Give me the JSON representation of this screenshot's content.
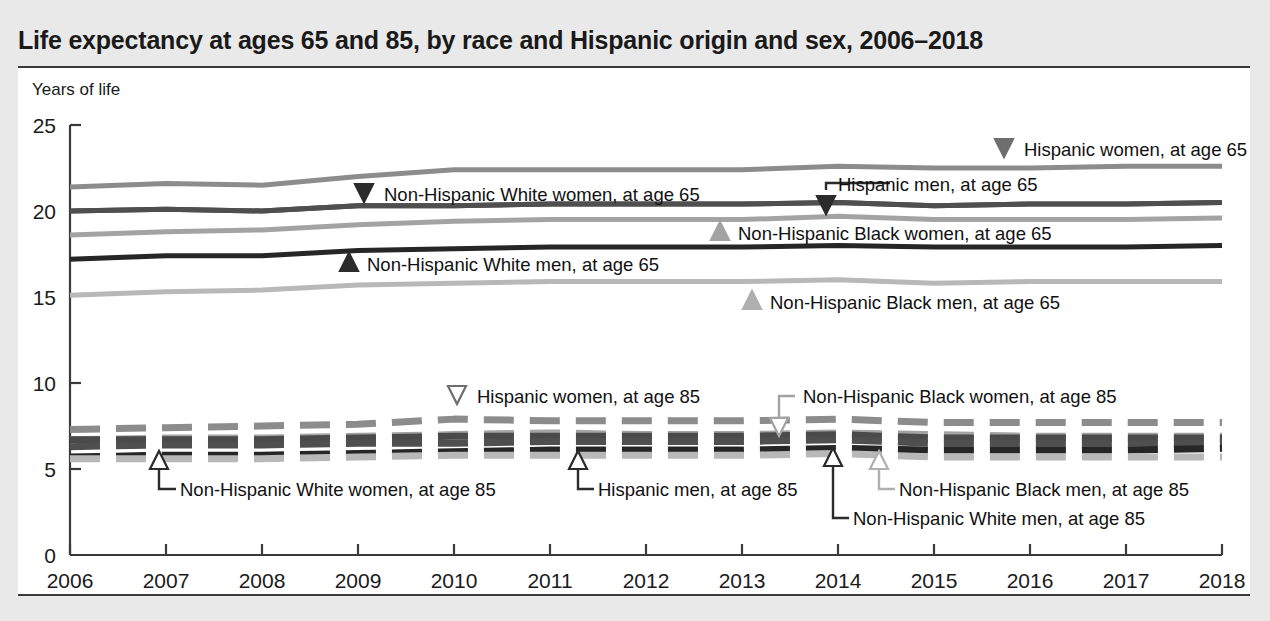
{
  "title": "Life expectancy at ages 65 and 85, by race and Hispanic origin and sex, 2006–2018",
  "axis_label_y": "Years of life",
  "colors": {
    "hispanic_women": "#8c8c8c",
    "hispanic_men": "#4f4f4f",
    "nh_white_women": "#4a4a4a",
    "nh_white_men": "#262626",
    "nh_black_women": "#a3a3a3",
    "nh_black_men": "#b8b8b8",
    "frame": "#3a3a3a",
    "page_bg": "#e9e9e9",
    "plot_bg": "#ffffff"
  },
  "annotations": [
    {
      "id": "hispanic-women-65",
      "text": "Hispanic women, at age 65",
      "marker": "filled-down-triangle",
      "color": "#6e6e6e"
    },
    {
      "id": "nh-white-women-65",
      "text": "Non-Hispanic White women, at age 65",
      "marker": "filled-down-triangle",
      "color": "#2b2b2b"
    },
    {
      "id": "hispanic-men-65",
      "text": "Hispanic men, at age 65",
      "marker": "leader-elbow-filled-down-triangle",
      "color": "#2b2b2b"
    },
    {
      "id": "nh-black-women-65",
      "text": "Non-Hispanic Black women, at age 65",
      "marker": "filled-up-triangle",
      "color": "#a3a3a3"
    },
    {
      "id": "nh-white-men-65",
      "text": "Non-Hispanic White men, at age 65",
      "marker": "filled-up-triangle",
      "color": "#2b2b2b"
    },
    {
      "id": "nh-black-men-65",
      "text": "Non-Hispanic Black men, at age 65",
      "marker": "filled-up-triangle",
      "color": "#b0b0b0"
    },
    {
      "id": "hispanic-women-85",
      "text": "Hispanic women, at age 85",
      "marker": "hollow-down-triangle",
      "color": "#6e6e6e"
    },
    {
      "id": "nh-black-women-85",
      "text": "Non-Hispanic Black women, at age 85",
      "marker": "leader-elbow-hollow-down-triangle",
      "color": "#a3a3a3"
    },
    {
      "id": "nh-white-women-85",
      "text": "Non-Hispanic White women, at age 85",
      "marker": "leader-elbow-hollow-up-triangle",
      "color": "#2b2b2b"
    },
    {
      "id": "hispanic-men-85",
      "text": "Hispanic men, at age 85",
      "marker": "leader-elbow-hollow-up-triangle",
      "color": "#2b2b2b"
    },
    {
      "id": "nh-white-men-85",
      "text": "Non-Hispanic White men, at age 85",
      "marker": "leader-elbow-hollow-up-triangle",
      "color": "#2b2b2b"
    },
    {
      "id": "nh-black-men-85",
      "text": "Non-Hispanic Black men, at age 85",
      "marker": "leader-elbow-hollow-up-triangle",
      "color": "#b0b0b0"
    }
  ],
  "chart_data": {
    "type": "line",
    "title": "Life expectancy at ages 65 and 85, by race and Hispanic origin and sex, 2006–2018",
    "xlabel": "",
    "ylabel": "Years of life",
    "x": [
      2006,
      2007,
      2008,
      2009,
      2010,
      2011,
      2012,
      2013,
      2014,
      2015,
      2016,
      2017,
      2018
    ],
    "xtick_labels": [
      "2006",
      "2007",
      "2008",
      "2009",
      "2010",
      "2011",
      "2012",
      "2013",
      "2014",
      "2015",
      "2016",
      "2017",
      "2018"
    ],
    "ytick_labels": [
      "0",
      "5",
      "10",
      "15",
      "20",
      "25"
    ],
    "yticks": [
      0,
      5,
      10,
      15,
      20,
      25
    ],
    "ylim": [
      0,
      25
    ],
    "xlim": [
      2006,
      2018
    ],
    "grid": false,
    "legend": "inline-annotations",
    "series": [
      {
        "name": "Hispanic women, at age 65",
        "style": "solid",
        "color": "#8c8c8c",
        "values": [
          21.4,
          21.6,
          21.5,
          22.0,
          22.4,
          22.4,
          22.4,
          22.4,
          22.6,
          22.5,
          22.5,
          22.6,
          22.6
        ]
      },
      {
        "name": "Non-Hispanic White women, at age 65",
        "style": "solid",
        "color": "#4a4a4a",
        "values": [
          20.0,
          20.1,
          20.0,
          20.3,
          20.3,
          20.4,
          20.4,
          20.4,
          20.5,
          20.3,
          20.4,
          20.4,
          20.5
        ]
      },
      {
        "name": "Hispanic men, at age 65",
        "style": "solid",
        "color": "#4f4f4f",
        "values": [
          20.0,
          20.1,
          20.0,
          20.3,
          20.3,
          20.4,
          20.4,
          20.4,
          20.5,
          20.3,
          20.4,
          20.4,
          20.5
        ]
      },
      {
        "name": "Non-Hispanic Black women, at age 65",
        "style": "solid",
        "color": "#a3a3a3",
        "values": [
          18.6,
          18.8,
          18.9,
          19.2,
          19.4,
          19.5,
          19.5,
          19.5,
          19.7,
          19.5,
          19.5,
          19.5,
          19.6
        ]
      },
      {
        "name": "Non-Hispanic White men, at age 65",
        "style": "solid",
        "color": "#262626",
        "values": [
          17.2,
          17.4,
          17.4,
          17.7,
          17.8,
          17.9,
          17.9,
          17.9,
          18.0,
          17.9,
          17.9,
          17.9,
          18.0
        ]
      },
      {
        "name": "Non-Hispanic Black men, at age 65",
        "style": "solid",
        "color": "#b8b8b8",
        "values": [
          15.1,
          15.3,
          15.4,
          15.7,
          15.8,
          15.9,
          15.9,
          15.9,
          16.0,
          15.8,
          15.9,
          15.9,
          15.9
        ]
      },
      {
        "name": "Hispanic women, at age 85",
        "style": "dashed",
        "color": "#8c8c8c",
        "values": [
          7.3,
          7.4,
          7.5,
          7.6,
          7.9,
          7.8,
          7.8,
          7.8,
          7.9,
          7.7,
          7.7,
          7.7,
          7.7
        ]
      },
      {
        "name": "Non-Hispanic Black women, at age 85",
        "style": "dashed",
        "color": "#a3a3a3",
        "values": [
          6.7,
          6.8,
          6.8,
          6.9,
          7.0,
          7.1,
          7.0,
          7.0,
          7.1,
          7.0,
          6.9,
          6.9,
          6.9
        ]
      },
      {
        "name": "Non-Hispanic White women, at age 85",
        "style": "dashed",
        "color": "#4a4a4a",
        "values": [
          6.7,
          6.7,
          6.7,
          6.8,
          6.9,
          6.9,
          6.9,
          6.9,
          7.0,
          6.8,
          6.8,
          6.8,
          6.8
        ]
      },
      {
        "name": "Hispanic men, at age 85",
        "style": "dashed",
        "color": "#4f4f4f",
        "values": [
          6.3,
          6.4,
          6.4,
          6.5,
          6.5,
          6.6,
          6.6,
          6.6,
          6.7,
          6.5,
          6.5,
          6.5,
          6.5
        ]
      },
      {
        "name": "Non-Hispanic White men, at age 85",
        "style": "dashed",
        "color": "#262626",
        "values": [
          5.7,
          5.8,
          5.8,
          5.9,
          6.0,
          6.1,
          6.1,
          6.1,
          6.2,
          6.1,
          6.1,
          6.1,
          6.2
        ]
      },
      {
        "name": "Non-Hispanic Black men, at age 85",
        "style": "dashed",
        "color": "#b8b8b8",
        "values": [
          5.6,
          5.6,
          5.6,
          5.7,
          5.8,
          5.8,
          5.8,
          5.8,
          5.9,
          5.7,
          5.7,
          5.7,
          5.7
        ]
      }
    ]
  }
}
